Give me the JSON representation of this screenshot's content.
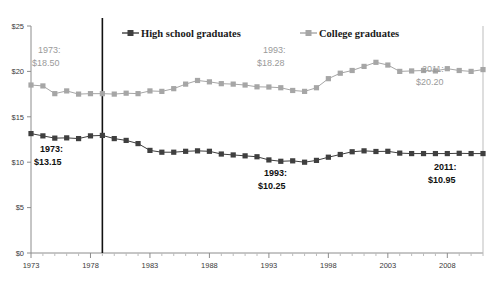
{
  "chart_data": {
    "type": "line",
    "title": "",
    "subtitle": "",
    "xlabel": "",
    "ylabel": "",
    "grid": false,
    "legend_position": "top",
    "xlim": [
      1973,
      2011
    ],
    "ylim": [
      0,
      25
    ],
    "ytick_values": [
      0,
      5,
      10,
      15,
      20,
      25
    ],
    "ytick_labels": [
      "$0",
      "$5",
      "$10",
      "$15",
      "$20",
      "$25"
    ],
    "xtick_labels": [
      "1973",
      "1978",
      "1983",
      "1988",
      "1993",
      "1998",
      "2003",
      "2008"
    ],
    "xtick_values": [
      1973,
      1978,
      1983,
      1988,
      1993,
      1998,
      2003,
      2008
    ],
    "x": [
      1973,
      1974,
      1975,
      1976,
      1977,
      1978,
      1979,
      1980,
      1981,
      1982,
      1983,
      1984,
      1985,
      1986,
      1987,
      1988,
      1989,
      1990,
      1991,
      1992,
      1993,
      1994,
      1995,
      1996,
      1997,
      1998,
      1999,
      2000,
      2001,
      2002,
      2003,
      2004,
      2005,
      2006,
      2007,
      2008,
      2009,
      2010,
      2011
    ],
    "series": [
      {
        "name": "High school graduates",
        "color": "#3f3f3f",
        "marker": "square",
        "values": [
          13.15,
          12.9,
          12.65,
          12.68,
          12.6,
          12.9,
          12.95,
          12.6,
          12.4,
          12.05,
          11.3,
          11.1,
          11.1,
          11.2,
          11.25,
          11.2,
          10.9,
          10.8,
          10.7,
          10.6,
          10.25,
          10.1,
          10.15,
          10.0,
          10.2,
          10.55,
          10.85,
          11.15,
          11.25,
          11.18,
          11.2,
          11.0,
          10.95,
          10.95,
          10.95,
          10.95,
          10.98,
          10.95,
          10.95
        ]
      },
      {
        "name": "College graduates",
        "color": "#a6a6a6",
        "marker": "square",
        "values": [
          18.5,
          18.4,
          17.55,
          17.85,
          17.5,
          17.55,
          17.55,
          17.5,
          17.6,
          17.55,
          17.85,
          17.8,
          18.1,
          18.6,
          19.0,
          18.85,
          18.65,
          18.6,
          18.5,
          18.3,
          18.28,
          18.2,
          17.9,
          17.8,
          18.2,
          19.2,
          19.8,
          20.1,
          20.55,
          21.0,
          20.7,
          20.0,
          20.05,
          20.1,
          20.05,
          20.3,
          20.1,
          20.0,
          20.2
        ]
      }
    ],
    "reference_line": {
      "x": 1979,
      "color": "#111111"
    },
    "annotations": [
      {
        "id": "hs-1973",
        "line1": "1973:",
        "line2": "$13.15",
        "series": "High school graduates",
        "style": "dark",
        "x_px": 40,
        "y_px": 152
      },
      {
        "id": "hs-1993",
        "line1": "1993:",
        "line2": "$10.25",
        "series": "High school graduates",
        "style": "dark",
        "x_px": 264,
        "y_px": 176
      },
      {
        "id": "hs-2011",
        "line1": "2011:",
        "line2": "$10.95",
        "series": "High school graduates",
        "style": "dark",
        "x_px": 434,
        "y_px": 170
      },
      {
        "id": "col-1973",
        "line1": "1973:",
        "line2": "$18.50",
        "series": "College graduates",
        "style": "light",
        "x_px": 38,
        "y_px": 53
      },
      {
        "id": "col-1993",
        "line1": "1993:",
        "line2": "$18.28",
        "series": "College graduates",
        "style": "light",
        "x_px": 263,
        "y_px": 53
      },
      {
        "id": "col-2011",
        "line1": "2011:",
        "line2": "$20.20",
        "series": "College graduates",
        "style": "light",
        "x_px": 422,
        "y_px": 72
      }
    ],
    "legend": [
      {
        "label": "High school graduates",
        "color": "#3f3f3f"
      },
      {
        "label": "College graduates",
        "color": "#a6a6a6"
      }
    ]
  }
}
